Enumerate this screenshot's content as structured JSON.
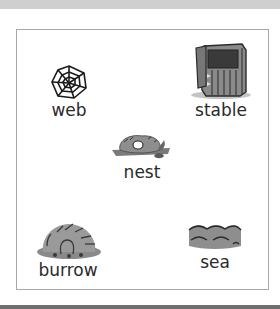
{
  "items": [
    {
      "id": "web",
      "label": "web",
      "icon": "spider-web-icon"
    },
    {
      "id": "stable",
      "label": "stable",
      "icon": "stable-icon"
    },
    {
      "id": "nest",
      "label": "nest",
      "icon": "nest-icon"
    },
    {
      "id": "burrow",
      "label": "burrow",
      "icon": "burrow-icon"
    },
    {
      "id": "sea",
      "label": "sea",
      "icon": "sea-waves-icon"
    }
  ],
  "colors": {
    "border": "#a8a8a8",
    "text": "#2a2a2a",
    "top_bar": "#cfcfcf",
    "bottom_bar": "#6e6e6e"
  }
}
